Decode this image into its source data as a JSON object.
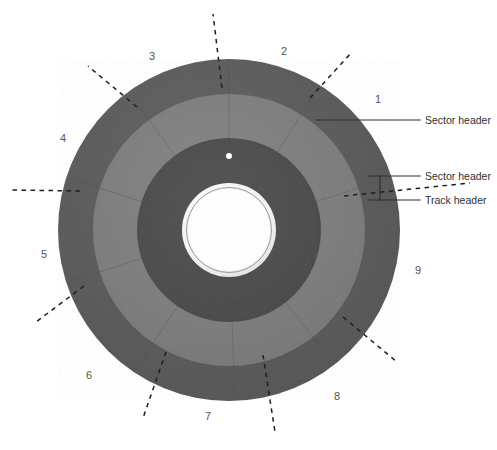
{
  "figure": {
    "disc": {
      "center_x": 229,
      "center_y": 230,
      "outer_radius": 171,
      "band_outer_inner_radius": 136,
      "band_middle_inner_radius": 92,
      "hub_outer_radius": 47,
      "hub_inner_radius": 41,
      "index_hole_radius": 3,
      "index_hole_offset_y": -74
    },
    "colors": {
      "outer_band": "#585858",
      "middle_band": "#7c7c7c",
      "inner_band": "#4c4c4c",
      "hub_ring": "#e8e8e8",
      "hub_hole": "#ffffff",
      "background": "#ffffff",
      "leader_line": "#2b2b2b",
      "divider_dash": "#1c1c1c",
      "number_text": "#555555",
      "label_text": "#2f2f2f"
    },
    "sector_numbers": [
      {
        "label": "1",
        "x": 375,
        "y": 94
      },
      {
        "label": "2",
        "x": 281,
        "y": 46
      },
      {
        "label": "3",
        "x": 149,
        "y": 51
      },
      {
        "label": "4",
        "x": 60,
        "y": 133
      },
      {
        "label": "5",
        "x": 41,
        "y": 249
      },
      {
        "label": "6",
        "x": 86,
        "y": 370
      },
      {
        "label": "7",
        "x": 205,
        "y": 411
      },
      {
        "label": "8",
        "x": 334,
        "y": 391
      },
      {
        "label": "9",
        "x": 415,
        "y": 265
      }
    ],
    "sector_divider_angles_deg": [
      -58,
      -90,
      -126,
      -162,
      -198,
      -236,
      -272,
      -308,
      -18
    ],
    "callouts": [
      {
        "id": "sector-header-outer",
        "label": "Sector header"
      },
      {
        "id": "sector-header-inner",
        "label": "Sector header"
      },
      {
        "id": "track-header",
        "label": "Track header"
      }
    ]
  }
}
